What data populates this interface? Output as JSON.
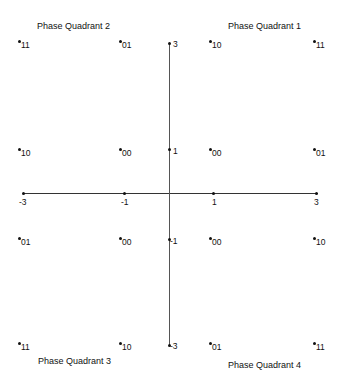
{
  "quadrants": {
    "q1": "Phase Quadrant 1",
    "q2": "Phase Quadrant 2",
    "q3": "Phase Quadrant 3",
    "q4": "Phase Quadrant 4"
  },
  "x_ticks": [
    "-3",
    "-1",
    "1",
    "3"
  ],
  "y_ticks": [
    "3",
    "1",
    "-1",
    "-3"
  ],
  "points": {
    "r1": [
      "11",
      "01",
      "10",
      "11"
    ],
    "r2": [
      "10",
      "00",
      "00",
      "01"
    ],
    "r3": [
      "01",
      "00",
      "00",
      "10"
    ],
    "r4": [
      "11",
      "10",
      "01",
      "11"
    ]
  }
}
